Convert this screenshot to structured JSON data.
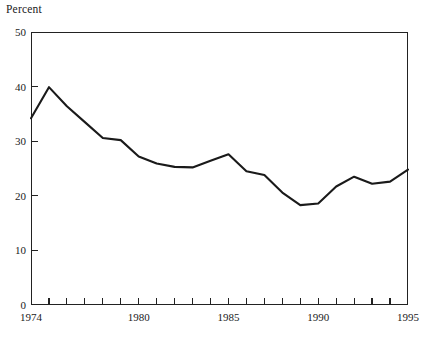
{
  "chart_data": {
    "type": "line",
    "title": "",
    "subtitle": "",
    "xlabel": "",
    "ylabel": "Percent",
    "ylim": [
      0,
      50
    ],
    "xlim": [
      1974,
      1995
    ],
    "grid": false,
    "legend": null,
    "y_ticks": [
      0,
      10,
      20,
      30,
      40,
      50
    ],
    "y_tick_labels": [
      "0",
      "10",
      "20",
      "30",
      "40",
      "50"
    ],
    "x_ticks": [
      1974,
      1975,
      1976,
      1977,
      1978,
      1979,
      1980,
      1981,
      1982,
      1983,
      1984,
      1985,
      1986,
      1987,
      1988,
      1989,
      1990,
      1991,
      1992,
      1993,
      1994,
      1995
    ],
    "x_tick_labels_shown": [
      "1974",
      "1980",
      "1985",
      "1990",
      "1995"
    ],
    "x_labeled_ticks": [
      1974,
      1980,
      1985,
      1990,
      1995
    ],
    "line_color": "#1a1a1a",
    "line_width": 2.1,
    "x": [
      1974,
      1975,
      1976,
      1977,
      1978,
      1979,
      1980,
      1981,
      1982,
      1983,
      1984,
      1985,
      1986,
      1987,
      1988,
      1989,
      1990,
      1991,
      1992,
      1993,
      1994,
      1995
    ],
    "values": [
      34.2,
      39.9,
      36.4,
      33.5,
      30.6,
      30.2,
      27.2,
      25.9,
      25.3,
      25.2,
      26.4,
      27.6,
      24.5,
      23.8,
      20.6,
      18.3,
      18.6,
      21.7,
      23.5,
      22.2,
      22.6,
      24.8
    ],
    "series": [
      {
        "name": "Percent",
        "values": [
          34.2,
          39.9,
          36.4,
          33.5,
          30.6,
          30.2,
          27.2,
          25.9,
          25.3,
          25.2,
          26.4,
          27.6,
          24.5,
          23.8,
          20.6,
          18.3,
          18.6,
          21.7,
          23.5,
          22.2,
          22.6,
          24.8
        ]
      }
    ]
  },
  "colors": {
    "background": "#ffffff",
    "axis": "#222222",
    "text": "#1a1a1a",
    "line": "#1a1a1a"
  }
}
